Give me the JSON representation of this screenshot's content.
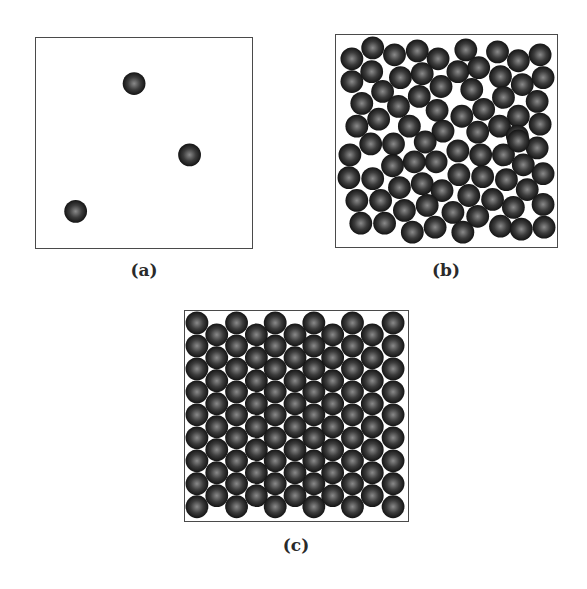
{
  "figure": {
    "sphere_style": {
      "radius": 11.5,
      "highlight_color": "#8a8a8a",
      "mid_color": "#3c3c3c",
      "edge_color": "#141414"
    },
    "panels": [
      {
        "id": "a",
        "label": "(a)",
        "description": "gas",
        "box": {
          "x": 35,
          "y": 37,
          "w": 218,
          "h": 212
        },
        "spheres": [
          [
            134,
            83
          ],
          [
            190,
            155
          ],
          [
            75,
            212
          ]
        ]
      },
      {
        "id": "b",
        "label": "(b)",
        "description": "liquid",
        "box": {
          "x": 335,
          "y": 34,
          "w": 223,
          "h": 214
        },
        "spheres": [
          [
            351,
            58
          ],
          [
            372,
            47
          ],
          [
            394,
            54
          ],
          [
            417,
            50
          ],
          [
            438,
            58
          ],
          [
            351,
            81
          ],
          [
            371,
            71
          ],
          [
            400,
            77
          ],
          [
            422,
            73
          ],
          [
            441,
            86
          ],
          [
            382,
            91
          ],
          [
            361,
            103
          ],
          [
            398,
            106
          ],
          [
            419,
            96
          ],
          [
            437,
            110
          ],
          [
            378,
            119
          ],
          [
            356,
            126
          ],
          [
            409,
            126
          ],
          [
            443,
            131
          ],
          [
            466,
            49
          ],
          [
            498,
            51
          ],
          [
            519,
            60
          ],
          [
            541,
            54
          ],
          [
            458,
            71
          ],
          [
            479,
            67
          ],
          [
            501,
            76
          ],
          [
            523,
            84
          ],
          [
            544,
            77
          ],
          [
            472,
            89
          ],
          [
            504,
            97
          ],
          [
            538,
            101
          ],
          [
            484,
            109
          ],
          [
            462,
            116
          ],
          [
            519,
            116
          ],
          [
            500,
            126
          ],
          [
            541,
            124
          ],
          [
            478,
            132
          ],
          [
            518,
            136
          ],
          [
            370,
            144
          ],
          [
            393,
            144
          ],
          [
            425,
            142
          ],
          [
            349,
            155
          ],
          [
            392,
            166
          ],
          [
            414,
            162
          ],
          [
            436,
            162
          ],
          [
            348,
            178
          ],
          [
            372,
            179
          ],
          [
            399,
            188
          ],
          [
            422,
            184
          ],
          [
            442,
            191
          ],
          [
            356,
            201
          ],
          [
            380,
            201
          ],
          [
            404,
            211
          ],
          [
            427,
            206
          ],
          [
            360,
            224
          ],
          [
            384,
            224
          ],
          [
            412,
            233
          ],
          [
            435,
            228
          ],
          [
            458,
            151
          ],
          [
            481,
            155
          ],
          [
            504,
            155
          ],
          [
            538,
            148
          ],
          [
            519,
            141
          ],
          [
            524,
            165
          ],
          [
            459,
            175
          ],
          [
            483,
            177
          ],
          [
            507,
            180
          ],
          [
            544,
            174
          ],
          [
            528,
            190
          ],
          [
            469,
            196
          ],
          [
            493,
            200
          ],
          [
            453,
            213
          ],
          [
            478,
            217
          ],
          [
            514,
            208
          ],
          [
            544,
            205
          ],
          [
            501,
            227
          ],
          [
            522,
            230
          ],
          [
            545,
            228
          ],
          [
            463,
            233
          ]
        ]
      },
      {
        "id": "c",
        "label": "(c)",
        "description": "solid",
        "box": {
          "x": 184,
          "y": 310,
          "w": 225,
          "h": 212
        },
        "lattice": {
          "columns_x": [
            196,
            216,
            236,
            256,
            275,
            295,
            314,
            333,
            353,
            373,
            394
          ],
          "odd_start_y": 322,
          "odd_count": 9,
          "even_start_y": 334,
          "even_count": 8,
          "row_spacing": 23.2
        }
      }
    ]
  }
}
